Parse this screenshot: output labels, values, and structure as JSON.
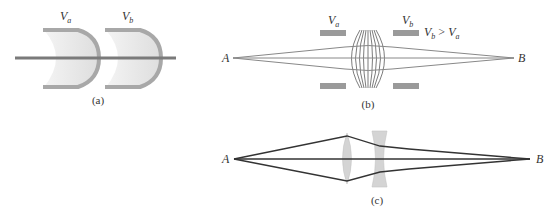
{
  "panel_a": {
    "caption": "(a)",
    "label_va": "V",
    "label_va_sub": "a",
    "label_vb": "V",
    "label_vb_sub": "b"
  },
  "panel_b": {
    "caption": "(b)",
    "point_a": "A",
    "point_b": "B",
    "label_va": "V",
    "label_va_sub": "a",
    "label_vb": "V",
    "label_vb_sub": "b",
    "condition_v1": "V",
    "condition_v1_sub": "b",
    "condition_op": " > ",
    "condition_v2": "V",
    "condition_v2_sub": "a"
  },
  "panel_c": {
    "caption": "(c)",
    "point_a": "A",
    "point_b": "B"
  },
  "colors": {
    "plate": "#9a9a9a",
    "electrode_fill": "#e6e6e6",
    "axis_line": "#7a7a7a",
    "ray_dark": "#333333",
    "lens_fill": "#d4d4d4"
  }
}
